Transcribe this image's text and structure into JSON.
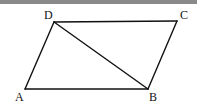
{
  "figure": {
    "type": "parallelogram-with-diagonal",
    "vertices": [
      {
        "name": "A",
        "x": 25,
        "y": 89,
        "label_x": 15,
        "label_y": 101
      },
      {
        "name": "B",
        "x": 148,
        "y": 89,
        "label_x": 149,
        "label_y": 101
      },
      {
        "name": "C",
        "x": 177,
        "y": 21,
        "label_x": 180,
        "label_y": 19
      },
      {
        "name": "D",
        "x": 54,
        "y": 22,
        "label_x": 44,
        "label_y": 19
      }
    ],
    "edges": [
      [
        "A",
        "B"
      ],
      [
        "B",
        "C"
      ],
      [
        "C",
        "D"
      ],
      [
        "D",
        "A"
      ]
    ],
    "diagonals": [
      [
        "D",
        "B"
      ]
    ],
    "stroke_color": "#111111",
    "topbar_color": "#8a8a8a"
  },
  "labels": {
    "A": "A",
    "B": "B",
    "C": "C",
    "D": "D"
  }
}
